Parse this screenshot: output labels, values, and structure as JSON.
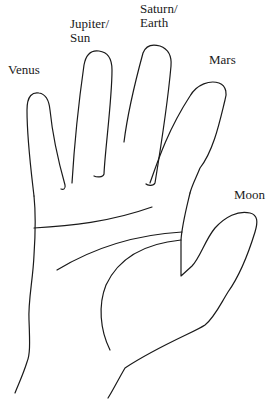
{
  "diagram": {
    "labels": {
      "venus": "Venus",
      "jupiter_line1": "Jupiter/",
      "jupiter_line2": "Sun",
      "saturn_line1": "Saturn/",
      "saturn_line2": "Earth",
      "mars": "Mars",
      "moon": "Moon"
    },
    "colors": {
      "stroke": "#1a1a1a",
      "background": "#ffffff"
    }
  }
}
